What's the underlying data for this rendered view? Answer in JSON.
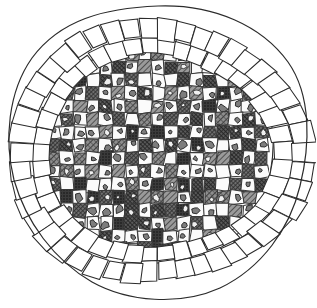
{
  "figure": {
    "kind": "scientific-line-drawing",
    "subject": "transverse section of a seed / root showing outer cell layers and checkerboard-patterned inner tissue",
    "medium": "black ink pen-and-hatching drawing on white paper",
    "canvas": {
      "width": 316,
      "height": 308
    },
    "background_color": "#ffffff",
    "ink_color": "#2b2b2b",
    "title": "",
    "caption": "",
    "labels": [],
    "text_present": false
  },
  "palette": {
    "paper": "#ffffff",
    "outline": "#2b2b2b",
    "cell_wall": "#3a3a3a",
    "light_cell": "#fbfbfb",
    "mid_cell": "#8a8a8a",
    "dark_cell": "#575757",
    "darkest_cell": "#2e2e2e",
    "grain_fill": "#7d7d7d"
  },
  "structure": {
    "outline": {
      "name": "outer-contour",
      "shape": "irregular-oval",
      "center": {
        "x": 158,
        "y": 152
      },
      "radius_x": 148,
      "radius_y": 142,
      "stroke_width": 1.1
    },
    "rings": [
      {
        "name": "outer-epidermis-ring",
        "description": "single file of elongated rectangular cells arranged radially around the circumference",
        "cell_count": 46,
        "thickness": 22,
        "fill": "#ffffff"
      },
      {
        "name": "inner-epidermis-ring",
        "description": "second, partial file of radial rectangular cells lying just inside the outer ring, strongest on lower and right sides",
        "cell_count": 42,
        "thickness": 16,
        "fill": "#ffffff"
      }
    ],
    "inner_tissue": {
      "name": "checkerboard-parenchyma",
      "description": "inner disc filled with a checkerboard mosaic of alternating dark cross-hatched cells and pale cells containing small irregular dark inclusions (starch grains)",
      "grid_columns": 19,
      "grid_rows": 18,
      "cell_size": 13,
      "radius_x": 112,
      "radius_y": 104,
      "cell_types": [
        {
          "type": "dark-hatched-cell",
          "fill": "#6d6d6d",
          "hatch": "cross-hatch"
        },
        {
          "type": "pale-cell-with-grain",
          "fill": "#fbfbfb",
          "inclusion": "irregular dark blob"
        }
      ]
    }
  },
  "seed": 20240517
}
